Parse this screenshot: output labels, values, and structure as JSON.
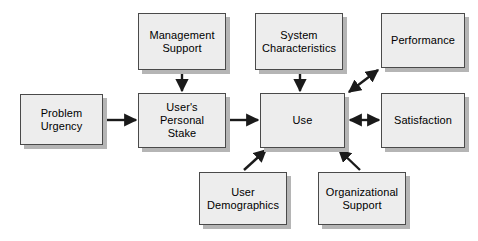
{
  "diagram": {
    "type": "flow-diagram",
    "background_color": "#ffffff",
    "node_fill_color": "#ededed",
    "node_border_color": "#4a4a4a",
    "node_shadow_color": "#b5b5b5",
    "arrow_color": "#1a1a1a",
    "nodes": [
      {
        "id": "problem-urgency",
        "label": "Problem\nUrgency"
      },
      {
        "id": "management-support",
        "label": "Management\nSupport"
      },
      {
        "id": "users-personal-stake",
        "label": "User's\nPersonal\nStake"
      },
      {
        "id": "system-characteristics",
        "label": "System\nCharacteristics"
      },
      {
        "id": "use",
        "label": "Use"
      },
      {
        "id": "performance",
        "label": "Performance"
      },
      {
        "id": "satisfaction",
        "label": "Satisfaction"
      },
      {
        "id": "user-demographics",
        "label": "User\nDemographics"
      },
      {
        "id": "organizational-support",
        "label": "Organizational\nSupport"
      }
    ],
    "edges": [
      {
        "id": "problem-urgency-to-users-personal-stake",
        "from": "problem-urgency",
        "to": "users-personal-stake",
        "style": "single",
        "orientation": "horizontal"
      },
      {
        "id": "management-support-to-users-personal-stake",
        "from": "management-support",
        "to": "users-personal-stake",
        "style": "single",
        "orientation": "vertical"
      },
      {
        "id": "users-personal-stake-to-use",
        "from": "users-personal-stake",
        "to": "use",
        "style": "single",
        "orientation": "horizontal"
      },
      {
        "id": "system-characteristics-to-use",
        "from": "system-characteristics",
        "to": "use",
        "style": "single",
        "orientation": "vertical"
      },
      {
        "id": "use-to-performance",
        "from": "use",
        "to": "performance",
        "style": "double",
        "orientation": "diagonal-up-right"
      },
      {
        "id": "use-to-satisfaction",
        "from": "use",
        "to": "satisfaction",
        "style": "double",
        "orientation": "horizontal"
      },
      {
        "id": "user-demographics-to-use",
        "from": "user-demographics",
        "to": "use",
        "style": "single",
        "orientation": "diagonal-up-right"
      },
      {
        "id": "organizational-support-to-use",
        "from": "organizational-support",
        "to": "use",
        "style": "single",
        "orientation": "diagonal-up-left"
      }
    ]
  }
}
